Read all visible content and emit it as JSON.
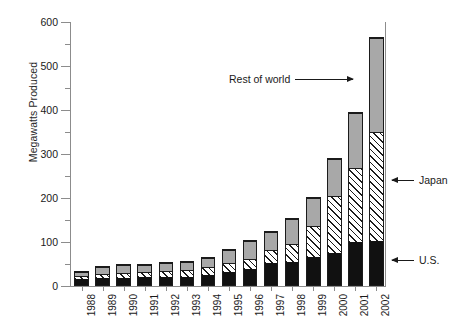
{
  "chart_data": {
    "type": "bar",
    "stacked": true,
    "title": "",
    "xlabel": "",
    "ylabel": "Megawatts Produced",
    "ylim": [
      0,
      600
    ],
    "ytick_step": 100,
    "yminor_step": 50,
    "grid": false,
    "legend_position": "annotations",
    "categories": [
      "1988",
      "1989",
      "1990",
      "1991",
      "1992",
      "1993",
      "1994",
      "1995",
      "1996",
      "1997",
      "1998",
      "1999",
      "2000",
      "2001",
      "2002"
    ],
    "ytick_labels": [
      "0",
      "100",
      "200",
      "300",
      "400",
      "500",
      "600"
    ],
    "series": [
      {
        "name": "U.S.",
        "fill": "solid-black",
        "color": "#111111",
        "values": [
          15,
          18,
          18,
          19,
          20,
          21,
          25,
          31,
          39,
          51,
          54,
          64,
          75,
          98,
          100
        ]
      },
      {
        "name": "Japan",
        "fill": "diagonal-hatch",
        "color": "#ffffff",
        "values": [
          9,
          10,
          13,
          14,
          15,
          17,
          19,
          21,
          24,
          31,
          43,
          74,
          130,
          172,
          250
        ]
      },
      {
        "name": "Rest of world",
        "fill": "solid-gray",
        "color": "#a8a8a8",
        "values": [
          11,
          17,
          18,
          18,
          20,
          18,
          22,
          33,
          41,
          42,
          58,
          65,
          85,
          125,
          215
        ]
      }
    ],
    "totals": [
      35,
      45,
      49,
      51,
      55,
      56,
      66,
      85,
      104,
      124,
      155,
      203,
      290,
      395,
      565
    ],
    "annotations": [
      {
        "name": "rest-of-world",
        "text": "Rest of world",
        "arrow": "right"
      },
      {
        "name": "japan",
        "text": "Japan",
        "arrow": "left"
      },
      {
        "name": "us",
        "text": "U.S.",
        "arrow": "left"
      }
    ]
  }
}
